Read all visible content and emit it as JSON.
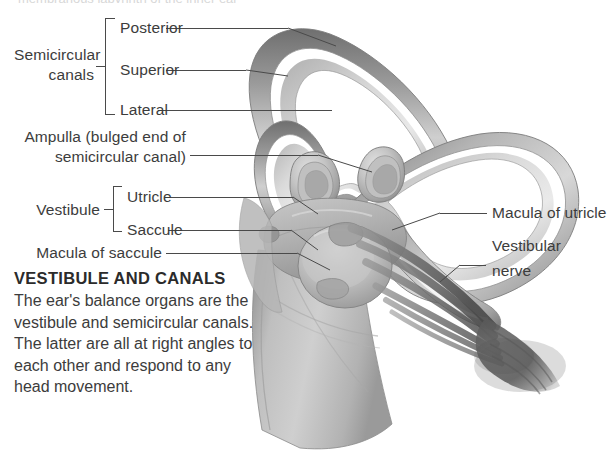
{
  "figure": {
    "top_clipped_text": "membranous labyrinth of the inner ear"
  },
  "colors": {
    "text": "#3c3c3c",
    "heading": "#2b2b2b",
    "leader_line": "#4a4a4a",
    "background": "#ffffff",
    "tissue_light": "#d2d2d2",
    "tissue_mid": "#b0b0b0",
    "tissue_dark": "#8a8a8a",
    "tissue_darkest": "#6a6a6a",
    "nerve": "#5e5e5e"
  },
  "labels": {
    "semicircular_canals": "Semicircular\ncanals",
    "semicircular_canals_line1": "Semicircular",
    "semicircular_canals_line2": "canals",
    "posterior": "Posterior",
    "superior": "Superior",
    "lateral": "Lateral",
    "ampulla_line1": "Ampulla (bulged end of",
    "ampulla_line2": "semicircular canal)",
    "vestibule": "Vestibule",
    "utricle": "Utricle",
    "saccule": "Saccule",
    "macula_of_saccule": "Macula of saccule",
    "macula_of_utricle": "Macula of utricle",
    "vestibular_nerve_line1": "Vestibular",
    "vestibular_nerve_line2": "nerve"
  },
  "caption": {
    "heading": "VESTIBULE AND CANALS",
    "body": "The ear's balance organs are the vestibule and semicircular canals. The latter are all at right angles to each other and respond to any head movement."
  }
}
